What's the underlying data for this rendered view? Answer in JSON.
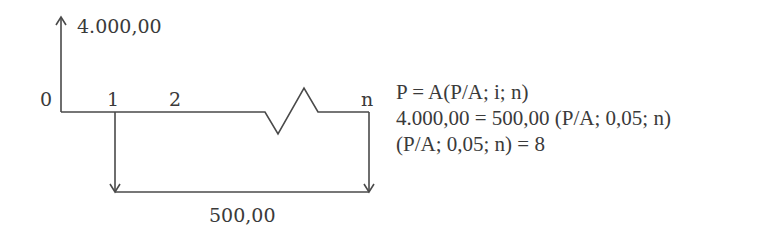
{
  "diagram": {
    "type": "cash-flow",
    "inflow": {
      "period": "0",
      "amount": "4.000,00",
      "direction": "up"
    },
    "outflow": {
      "periods_from": "1",
      "periods_to": "n",
      "amount": "500,00",
      "direction": "down"
    },
    "period_labels": [
      "0",
      "1",
      "2",
      "n"
    ],
    "line_color": "#4a4a4a",
    "text_color": "#3a3a3a"
  },
  "equations": [
    "P = A(P/A; i; n)",
    "4.000,00 = 500,00 (P/A; 0,05; n)",
    "(P/A; 0,05; n) = 8"
  ]
}
